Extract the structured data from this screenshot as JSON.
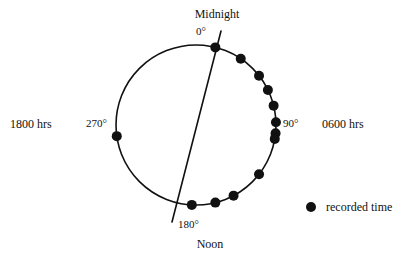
{
  "figure": {
    "title": "",
    "kind": "circular-plot"
  },
  "labels": {
    "midnight": "Midnight",
    "noon": "Noon",
    "deg_0": "0°",
    "deg_90": "90°",
    "deg_180": "180°",
    "deg_270": "270°",
    "hrs_1800": "1800 hrs",
    "hrs_0600": "0600 hrs"
  },
  "legend": {
    "marker_label": "recorded time",
    "marker_shape": "filled-circle",
    "marker_color": "#111111"
  },
  "style": {
    "line_color": "#111111",
    "circle_stroke_width": 1.6,
    "axis_stroke_width": 1.6,
    "dot_radius": 5.0,
    "background": "#ffffff"
  },
  "chart_data": {
    "type": "scatter",
    "coordinate_system": "polar-clock",
    "title": "",
    "xlabel": "",
    "ylabel": "",
    "grid": false,
    "legend_position": "right-bottom",
    "center": {
      "x": 196,
      "y": 125
    },
    "radius": 80,
    "angle_convention": {
      "zero_at": "top",
      "direction": "clockwise",
      "degrees_per_hour": 15,
      "note": "0° = Midnight, 90° = 0600 hrs, 180° = Noon, 270° = 1800 hrs"
    },
    "axis_ticks_deg": [
      0,
      90,
      180,
      270
    ],
    "axis_tick_labels": [
      "0°",
      "90°",
      "180°",
      "270°"
    ],
    "time_ticks": [
      "Midnight",
      "0600 hrs",
      "Noon",
      "1800 hrs"
    ],
    "mean_axis_line": {
      "label": "",
      "angle_deg": 12,
      "x1": 221,
      "y1": 31,
      "x2": 172,
      "y2": 222
    },
    "series": [
      {
        "name": "recorded time",
        "marker": "filled-circle",
        "color": "#111111",
        "angles_deg": [
          14,
          34,
          52,
          64,
          76,
          88,
          96,
          100,
          128,
          152,
          166,
          183,
          262
        ],
        "clock_times": [
          "0056",
          "0216",
          "0328",
          "0416",
          "0504",
          "0552",
          "0624",
          "0640",
          "0832",
          "1008",
          "1104",
          "1212",
          "1728"
        ],
        "count": 13
      }
    ]
  }
}
